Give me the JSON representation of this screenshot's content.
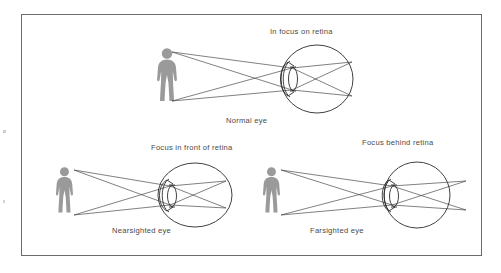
{
  "figure": {
    "title_alt": "Eye focusing diagram: normal, nearsighted, and farsighted eyes",
    "border": {
      "x": 21,
      "y": 14,
      "width": 461,
      "height": 242,
      "color": "#6b6b6b"
    },
    "colors": {
      "line": "#2b2b2b",
      "ray": "#3c3c3c",
      "person": "#9a9a9a",
      "text": "#4a4a4a",
      "background": "#ffffff"
    },
    "panels": [
      {
        "id": "normal",
        "top_label": "In focus on retina",
        "bottom_label": "Normal eye",
        "person_name": "person-silhouette-normal",
        "eye_name": "eye-normal"
      },
      {
        "id": "nearsighted",
        "top_label": "Focus in front of retina",
        "bottom_label": "Nearsighted eye",
        "person_name": "person-silhouette-nearsighted",
        "eye_name": "eye-nearsighted"
      },
      {
        "id": "farsighted",
        "top_label": "Focus behind retina",
        "bottom_label": "Farsighted eye",
        "person_name": "person-silhouette-farsighted",
        "eye_name": "eye-farsighted"
      }
    ],
    "labels": {
      "normal_top": {
        "text": "In focus on retina",
        "x": 270,
        "y": 32
      },
      "normal_bottom": {
        "text": "Normal eye",
        "x": 226,
        "y": 120
      },
      "near_top": {
        "text": "Focus in front of retina",
        "x": 151,
        "y": 148
      },
      "far_top": {
        "text": "Focus behind retina",
        "x": 363,
        "y": 143
      },
      "near_bottom": {
        "text": "Nearsighted eye",
        "x": 113,
        "y": 230
      },
      "far_bottom": {
        "text": "Farsighted eye",
        "x": 311,
        "y": 230
      }
    }
  }
}
